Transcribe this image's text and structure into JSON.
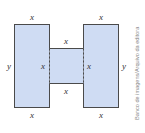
{
  "figure": {
    "fill_color": "#cfdcf3",
    "stroke_color": "#4a4a4a",
    "labels": {
      "left_top": "x",
      "left_bottom": "x",
      "left_side": "y",
      "right_top": "x",
      "right_bottom": "x",
      "right_side": "y",
      "middle_top": "x",
      "middle_bottom": "x",
      "middle_left": "x",
      "middle_right": "x"
    }
  },
  "credit": "Banco de imagens/Arquivo da editora"
}
